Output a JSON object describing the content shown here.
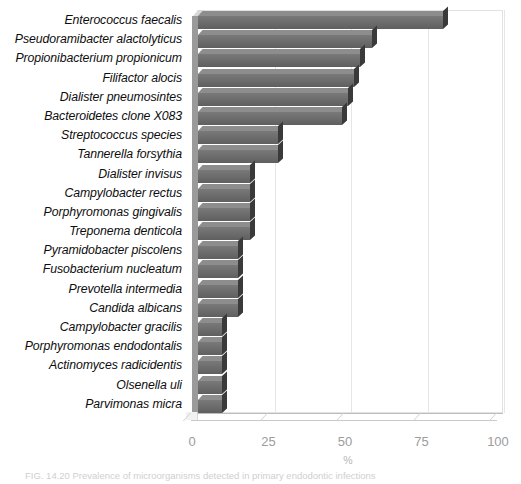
{
  "chart_data": {
    "type": "bar",
    "orientation": "horizontal",
    "title": "",
    "xlabel": "%",
    "ylabel": "",
    "xlim": [
      0,
      100
    ],
    "xticks": [
      "0",
      "25",
      "50",
      "75",
      "100"
    ],
    "grid": true,
    "legend": "none",
    "bar_color": "#6b6b6b",
    "bar_edge_color": "#3a3a3a",
    "categories": [
      "Enterococcus faecalis",
      "Pseudoramibacter alactolyticus",
      "Propionibacterium propionicum",
      "Filifactor alocis",
      "Dialister pneumosintes",
      "Bacteroidetes clone X083",
      "Streptococcus species",
      "Tannerella forsythia",
      "Dialister invisus",
      "Campylobacter rectus",
      "Porphyromonas gingivalis",
      "Treponema denticola",
      "Pyramidobacter piscolens",
      "Fusobacterium nucleatum",
      "Prevotella intermedia",
      "Candida albicans",
      "Campylobacter gracilis",
      "Porphyromonas endodontalis",
      "Actinomyces radicidentis",
      "Olsenella uli",
      "Parvimonas micra"
    ],
    "values": [
      80,
      57,
      53,
      51,
      49,
      47,
      26,
      26,
      17,
      17,
      17,
      17,
      13,
      13,
      13,
      13,
      8,
      8,
      8,
      8,
      8
    ]
  },
  "caption": {
    "text": "FIG. 14.20 Prevalence of microorganisms detected in primary endodontic infections"
  }
}
